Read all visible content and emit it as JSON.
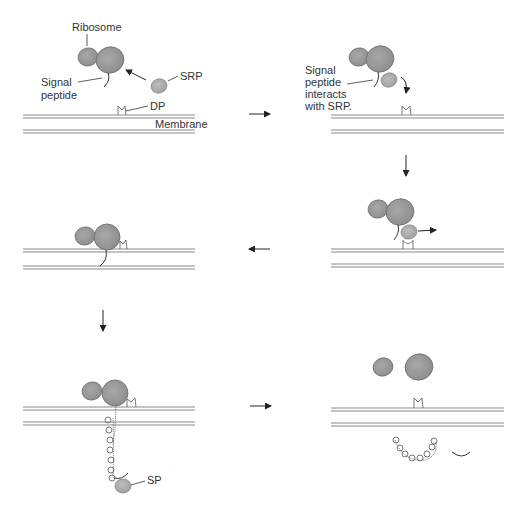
{
  "colors": {
    "membrane": "#8a8a8a",
    "ribosome_fill": "#9a9a9a",
    "ribosome_stroke": "#6e6e6e",
    "srp_fill": "#b0b0b0",
    "line": "#333333",
    "text": "#333333",
    "background": "#ffffff"
  },
  "panels": [
    {
      "id": "panel-1",
      "labels": {
        "ribosome": "Ribosome",
        "signal_line1": "Signal",
        "signal_line2": "peptide",
        "srp": "SRP",
        "dp": "DP",
        "membrane": "Membrane"
      }
    },
    {
      "id": "panel-2",
      "labels": {
        "line1": "Signal",
        "line2": "peptide",
        "line3": "interacts",
        "line4": "with SRP."
      }
    },
    {
      "id": "panel-3",
      "labels": {}
    },
    {
      "id": "panel-4",
      "labels": {}
    },
    {
      "id": "panel-5",
      "labels": {
        "sp": "SP"
      }
    },
    {
      "id": "panel-6",
      "labels": {}
    }
  ],
  "flow_arrows": [
    {
      "from": "panel-1",
      "to": "panel-2",
      "direction": "right"
    },
    {
      "from": "panel-2",
      "to": "panel-4",
      "direction": "down"
    },
    {
      "from": "panel-4",
      "to": "panel-3",
      "direction": "left"
    },
    {
      "from": "panel-3",
      "to": "panel-5",
      "direction": "down"
    },
    {
      "from": "panel-5",
      "to": "panel-6",
      "direction": "right"
    }
  ]
}
